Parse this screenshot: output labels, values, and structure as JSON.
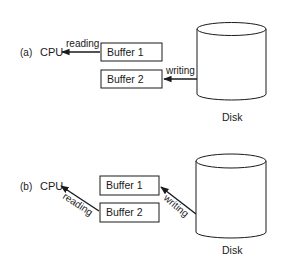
{
  "panels": [
    {
      "label": "(a)",
      "cpu": "CPU",
      "buffers": [
        "Buffer 1",
        "Buffer 2"
      ],
      "read_label": "reading",
      "write_label": "writing",
      "disk": "Disk"
    },
    {
      "label": "(b)",
      "cpu": "CPU",
      "buffers": [
        "Buffer 1",
        "Buffer 2"
      ],
      "read_label": "reading",
      "write_label": "writing",
      "disk": "Disk"
    }
  ],
  "colors": {
    "stroke": "#1a1a1a",
    "background": "#ffffff"
  }
}
